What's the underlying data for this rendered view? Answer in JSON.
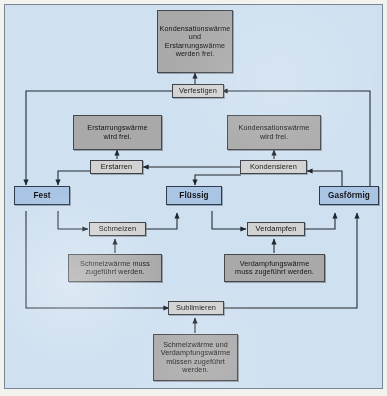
{
  "diagram": {
    "title_visible": false,
    "background_color": "#cfe0f0",
    "border_color": "#7a8694",
    "colors": {
      "heat_box": "#a9a9a9",
      "process_box": "#d2d2d2",
      "state_box": "#aac4e4",
      "line": "#20252b"
    }
  },
  "nodes": {
    "heat_top": "Kondensationswärme\nund\nErstarrungswärme\nwerden frei.",
    "proc_verfestigen": "Verfestigen",
    "heat_erstarrung": "Erstarrungswärme\nwird frei.",
    "heat_kondensation": "Kondensationswärme\nwird frei.",
    "proc_erstarren": "Erstarren",
    "proc_kondensieren": "Kondensieren",
    "state_fest": "Fest",
    "state_fluessig": "Flüssig",
    "state_gasfoermig": "Gasförmig",
    "proc_schmelzen": "Schmelzen",
    "proc_verdampfen": "Verdampfen",
    "heat_schmelz": "Schmelzwärme muss\nzugeführt werden.",
    "heat_verdampfung": "Verdampfungswärme\nmuss zugeführt werden.",
    "proc_sublimieren": "Sublimieren",
    "heat_bottom": "Schmelzwärme und\nVerdampfungswärme\nmüssen zugeführt\nwerden."
  },
  "edges": [
    "verfestigen-to-heat-top",
    "verfestigen-to-fest",
    "gasfoermig-to-verfestigen",
    "erstarren-to-heat-erstarrung",
    "kondensieren-to-heat-kondensation",
    "kondensieren-to-erstarren",
    "erstarren-to-fest",
    "gasfoermig-to-kondensieren",
    "kondensieren-to-fluessig",
    "fest-to-schmelzen",
    "schmelzen-to-fluessig",
    "heat-schmelz-to-schmelzen",
    "fluessig-to-verdampfen",
    "verdampfen-to-gasfoermig",
    "heat-verdampfung-to-verdampfen",
    "fest-to-sublimieren",
    "sublimieren-to-gasfoermig",
    "heat-bottom-to-sublimieren"
  ]
}
